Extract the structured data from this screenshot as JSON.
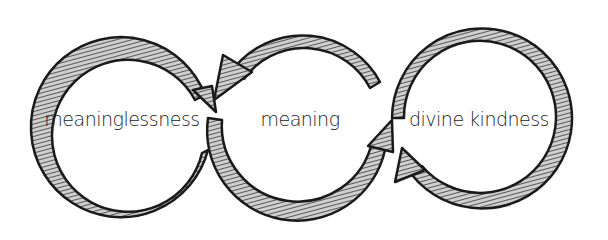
{
  "diagram": {
    "type": "cycle-of-linked-circles",
    "style": "hand-drawn hatched arrows",
    "colors": {
      "stroke": "#1a1a1a",
      "hatch": "#555555",
      "background": "#ffffff"
    },
    "nodes": [
      {
        "id": "n1",
        "label": "meaninglessness",
        "cx": 122,
        "cy": 120
      },
      {
        "id": "n2",
        "label": "meaning",
        "cx": 300,
        "cy": 120
      },
      {
        "id": "n3",
        "label": "divine kindness",
        "cx": 480,
        "cy": 120
      }
    ],
    "edges": [
      {
        "from": "meaning",
        "to": "meaninglessness",
        "desc": "arrow along top of middle circle pointing into left circle"
      },
      {
        "from": "meaninglessness",
        "to": "meaning",
        "desc": "left circle arrow flows back into the middle"
      },
      {
        "from": "meaning",
        "to": "divine kindness",
        "desc": "arrow along bottom of middle circle pointing up into right circle"
      },
      {
        "from": "divine kindness",
        "to": "meaning",
        "desc": "right circle arrow pointing up at its lower-left"
      }
    ]
  }
}
